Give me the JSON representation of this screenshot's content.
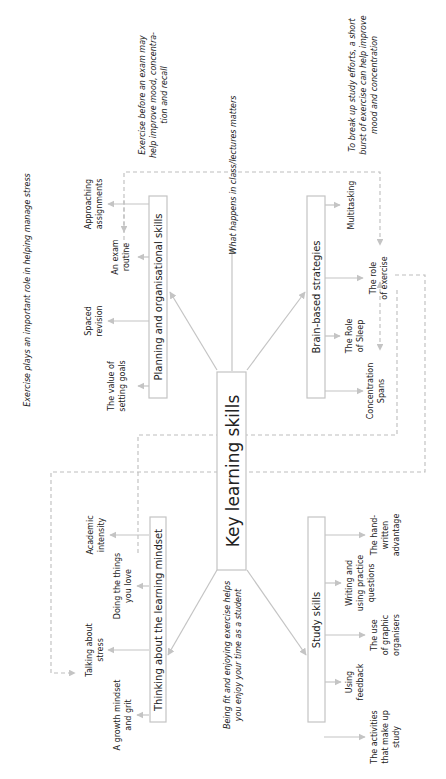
{
  "diagram": {
    "title": "Key learning skills",
    "orientation": "rotated 90 degrees counter-clockwise",
    "branches": [
      {
        "id": "planning",
        "label": "Planning and organisational skills",
        "children": [
          "The value of setting goals",
          "Spaced revision",
          "An exam routine",
          "Approaching assignments"
        ]
      },
      {
        "id": "brain",
        "label": "Brain-based strategies",
        "children": [
          "Concentration Spans",
          "The Role of Sleep",
          "The role of exercise",
          "Multitasking"
        ]
      },
      {
        "id": "mindset",
        "label": "Thinking about the learning mindset",
        "children": [
          "A growth mindset and grit",
          "Talking about stress",
          "Doing the things you love",
          "Academic intensity"
        ]
      },
      {
        "id": "study",
        "label": "Study skills",
        "children": [
          "The activities that make up study",
          "Using feedback",
          "The use of graphic organisers",
          "Writing and using practice questions",
          "The hand-written advantage"
        ]
      }
    ],
    "annotations": {
      "exam_exercise": "Exercise before an exam may help improve mood, concentration and recall",
      "lectures": "What happens in class/lectures matters",
      "break_up": "To break up study efforts, a short burst of exercise can help improve mood and concentration",
      "stress": "Exercise plays an important role in helping manage stress",
      "fit": "Being fit and enjoying exercise helps you enjoy your time as a student"
    }
  },
  "labels": {
    "center": "Key learning skills",
    "b_planning": "Planning and organisational skills",
    "b_brain": "Brain-based strategies",
    "b_mindset": "Thinking about the learning mindset",
    "b_study": "Study skills",
    "p1a": "The value of",
    "p1b": "setting goals",
    "p2a": "Spaced",
    "p2b": "revision",
    "p3a": "An exam",
    "p3b": "routine",
    "p4a": "Approaching",
    "p4b": "assignments",
    "r1a": "Concentration",
    "r1b": "Spans",
    "r2a": "The Role",
    "r2b": "of Sleep",
    "r3a": "The role",
    "r3b": "of exercise",
    "r4a": "Multitasking",
    "m1a": "A growth mindset",
    "m1b": "and grit",
    "m2a": "Talking about",
    "m2b": "stress",
    "m3a": "Doing the things",
    "m3b": "you love",
    "m4a": "Academic",
    "m4b": "intensity",
    "s1a": "The activities",
    "s1b": "that make up",
    "s1c": "study",
    "s2a": "Using",
    "s2b": "feedback",
    "s3a": "The use",
    "s3b": "of graphic",
    "s3c": "organisers",
    "s4a": "Writing and",
    "s4b": "using practice",
    "s4c": "questions",
    "s5a": "The hand-",
    "s5b": "written",
    "s5c": "advantage",
    "a1a": "Exercise before an exam may",
    "a1b": "help improve mood, concentra-",
    "a1c": "tion and recall",
    "a2a": "What happens in class/lectures matters",
    "a3a": "To break up study efforts, a short",
    "a3b": "burst of exercise can help improve",
    "a3c": "mood and concentration",
    "a4a": "Exercise plays an important role in helping manage stress",
    "a5a": "Being fit and enjoying exercise helps",
    "a5b": "you enjoy your time as a student"
  }
}
